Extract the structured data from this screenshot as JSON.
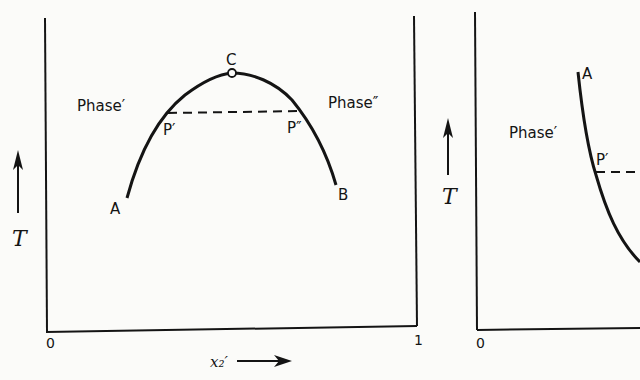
{
  "left_panel": {
    "axis_label_y": "T",
    "axis_label_x": "x₂′",
    "x_tick_start": "0",
    "x_tick_end": "1",
    "region_left": "Phase′",
    "region_right": "Phase″",
    "curve_points": {
      "start": "A",
      "end": "B",
      "critical": "C",
      "tie_left": "P′",
      "tie_right": "P″"
    }
  },
  "right_panel": {
    "axis_label_y": "T",
    "x_tick_start": "0",
    "region_left": "Phase′",
    "curve_points": {
      "start": "A",
      "tie_left": "P′"
    }
  },
  "colors": {
    "ink": "#141414",
    "paper": "#fbfbf9"
  }
}
